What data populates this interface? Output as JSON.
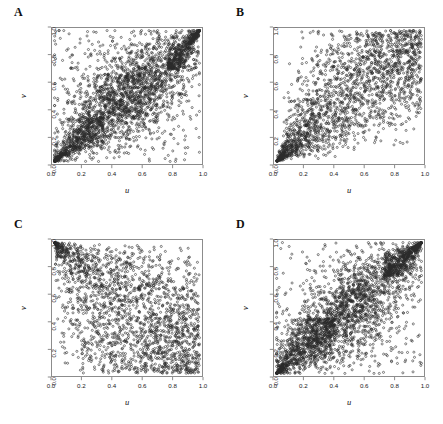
{
  "figure": {
    "type": "scatter-matrix",
    "panel_count": 4,
    "layout": "2x2",
    "background_color": "#ffffff",
    "point_color": "#2b2b2b",
    "frame_color": "#8c8c8c"
  },
  "axes": {
    "x_label": "u",
    "y_label": "v",
    "x_ticks": [
      "0.0",
      "0.2",
      "0.4",
      "0.6",
      "0.8",
      "1.0"
    ],
    "y_ticks": [
      "0.0",
      "0.2",
      "0.4",
      "0.6",
      "0.8",
      "1.0"
    ],
    "x_tick_values": [
      0.0,
      0.2,
      0.4,
      0.6,
      0.8,
      1.0
    ],
    "y_tick_values": [
      0.0,
      0.2,
      0.4,
      0.6,
      0.8,
      1.0
    ],
    "xlim": [
      0,
      1
    ],
    "ylim": [
      0,
      1
    ]
  },
  "panels": [
    {
      "letter": "A",
      "n_points": 3000,
      "dependence": "both-tail",
      "seed": 11
    },
    {
      "letter": "B",
      "n_points": 2000,
      "dependence": "lower-tail",
      "seed": 23
    },
    {
      "letter": "C",
      "n_points": 2000,
      "dependence": "negative",
      "seed": 37
    },
    {
      "letter": "D",
      "n_points": 3000,
      "dependence": "both-tail-strong",
      "seed": 51
    }
  ],
  "chart_data": {
    "type": "scatter",
    "title": "",
    "xlabel": "u",
    "ylabel": "v",
    "xlim": [
      0,
      1
    ],
    "ylim": [
      0,
      1
    ],
    "grid": false,
    "legend": "none",
    "xticks": [
      0.0,
      0.2,
      0.4,
      0.6,
      0.8,
      1.0
    ],
    "yticks": [
      0.0,
      0.2,
      0.4,
      0.6,
      0.8,
      1.0
    ],
    "marker": "open-circle",
    "marker_size": 2.1,
    "panels": [
      {
        "label": "A",
        "n": 3000,
        "description": "Copula sample on unit square with dependence along the diagonal; heavy concentration at the lower-left cusp and the upper-right corner, moderate scatter elsewhere.",
        "kendall_tau_approx": 0.45,
        "lower_tail_dependence": 0.55,
        "upper_tail_dependence": 0.55
      },
      {
        "label": "B",
        "n": 2000,
        "description": "Strong lower-tail dependence; points converge to a tight cusp at the origin and fan out broadly toward the upper right.",
        "kendall_tau_approx": 0.55,
        "lower_tail_dependence": 0.8,
        "upper_tail_dependence": 0.05
      },
      {
        "label": "C",
        "n": 2000,
        "description": "Negative dependence; density concentrated in the upper-left and lower-right corners with a sparse band along the rising diagonal.",
        "kendall_tau_approx": -0.4,
        "lower_tail_dependence": 0.0,
        "upper_tail_dependence": 0.0
      },
      {
        "label": "D",
        "n": 3000,
        "description": "Both-tail dependence; dense clusters in the lower-left and upper-right corners with broad scatter through the interior.",
        "kendall_tau_approx": 0.5,
        "lower_tail_dependence": 0.65,
        "upper_tail_dependence": 0.65
      }
    ]
  }
}
